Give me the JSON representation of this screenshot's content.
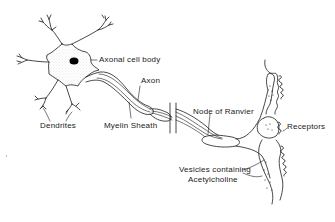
{
  "diagram": {
    "type": "neuron-anatomy",
    "colors": {
      "background": "#ffffff",
      "line": "#1a1a1a",
      "nucleus": "#000000",
      "stipple": "#9a9a9a"
    },
    "labels": {
      "cell_body": "Axonal cell body",
      "axon": "Axon",
      "dendrites": "Dendrites",
      "myelin_sheath": "Myelin Sheath",
      "node_of_ranvier": "Node of Ranvier",
      "receptors": "Receptors",
      "vesicles_line1": "Vesicles containing",
      "vesicles_line2": "Acetylcholine"
    }
  }
}
